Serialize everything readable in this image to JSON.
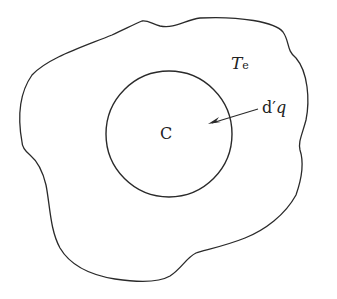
{
  "diagram": {
    "labels": {
      "outer_region": "T",
      "outer_region_subscript": "e",
      "inner_region": "C",
      "heat_flow_d": "d′",
      "heat_flow_q": "q"
    },
    "colors": {
      "stroke": "#2a2a2a",
      "background": "#ffffff",
      "text": "#222222"
    },
    "shapes": {
      "inner_circle": {
        "cx": 169,
        "cy": 134,
        "r": 63
      },
      "arrow": {
        "from": [
          258,
          109
        ],
        "to": [
          209,
          124
        ]
      }
    }
  }
}
